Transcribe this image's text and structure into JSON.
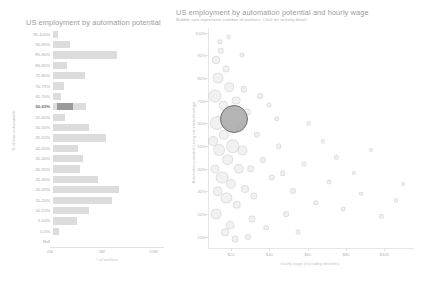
{
  "left_chart": {
    "title": "US employment by automation potential",
    "yaxis_title": "% of time automatable",
    "xaxis_title": "# of workers",
    "xticks": [
      "0M",
      "5M",
      "10M"
    ],
    "selected_band": "60-65%",
    "bands": [
      {
        "label": "95-100%",
        "workers_m": 0.45
      },
      {
        "label": "90-95%",
        "workers_m": 1.6
      },
      {
        "label": "85-90%",
        "workers_m": 6.15
      },
      {
        "label": "80-85%",
        "workers_m": 1.35
      },
      {
        "label": "75-80%",
        "workers_m": 3.05
      },
      {
        "label": "70-75%",
        "workers_m": 1.05
      },
      {
        "label": "65-70%",
        "workers_m": 0.8
      },
      {
        "label": "60-65%",
        "workers_m": 3.2
      },
      {
        "label": "55-60%",
        "workers_m": 1.2
      },
      {
        "label": "50-55%",
        "workers_m": 3.45
      },
      {
        "label": "45-50%",
        "workers_m": 5.1
      },
      {
        "label": "40-45%",
        "workers_m": 2.4
      },
      {
        "label": "35-40%",
        "workers_m": 2.85
      },
      {
        "label": "30-35%",
        "workers_m": 2.6
      },
      {
        "label": "25-30%",
        "workers_m": 4.35
      },
      {
        "label": "20-25%",
        "workers_m": 6.4
      },
      {
        "label": "15-20%",
        "workers_m": 5.7
      },
      {
        "label": "10-15%",
        "workers_m": 3.5
      },
      {
        "label": "5-10%",
        "workers_m": 2.35
      },
      {
        "label": "0-5%",
        "workers_m": 0.55
      },
      {
        "label": "Null",
        "workers_m": 0.0
      }
    ]
  },
  "right_chart": {
    "title": "US employment by automation potential and hourly wage",
    "subtitle": "Bubble size represents number of workers.  Click for activity detail",
    "yaxis_title": "Automation potential (using current technology)",
    "xaxis_title": "hourly wage (excluding benefits)",
    "yticks": [
      "100%",
      "90%",
      "80%",
      "70%",
      "60%",
      "50%",
      "40%",
      "30%",
      "20%",
      "10%"
    ],
    "xticks": [
      "$20",
      "$40",
      "$60",
      "$80",
      "$100"
    ],
    "selected_bubble": {
      "wage": 21.5,
      "automation_pct": 62,
      "size_px": 26
    }
  },
  "chart_data": [
    {
      "type": "bar",
      "title": "US employment by automation potential",
      "xlabel": "# of workers",
      "ylabel": "% of time automatable",
      "orientation": "horizontal",
      "categories": [
        "95-100%",
        "90-95%",
        "85-90%",
        "80-85%",
        "75-80%",
        "70-75%",
        "65-70%",
        "60-65%",
        "55-60%",
        "50-55%",
        "45-50%",
        "40-45%",
        "35-40%",
        "30-35%",
        "25-30%",
        "20-25%",
        "15-20%",
        "10-15%",
        "5-10%",
        "0-5%",
        "Null"
      ],
      "values": [
        0.45,
        1.6,
        6.15,
        1.35,
        3.05,
        1.05,
        0.8,
        3.2,
        1.2,
        3.45,
        5.1,
        2.4,
        2.85,
        2.6,
        4.35,
        6.4,
        5.7,
        3.5,
        2.35,
        0.55,
        0.0
      ],
      "value_unit": "millions of workers",
      "xlim": [
        0,
        11
      ],
      "xtick_values": [
        0,
        5,
        10
      ],
      "xtick_labels": [
        "0M",
        "5M",
        "10M"
      ],
      "grid": false,
      "legend": "none",
      "highlight": {
        "category": "60-65%",
        "sub_value": 1.55
      }
    },
    {
      "type": "scatter",
      "title": "US employment by automation potential and hourly wage",
      "subtitle": "Bubble size represents number of workers.  Click for activity detail",
      "xlabel": "hourly wage (excluding benefits)",
      "ylabel": "Automation potential (using current technology)",
      "xlim": [
        8,
        115
      ],
      "ylim": [
        5,
        102
      ],
      "xtick_values": [
        20,
        40,
        60,
        80,
        100
      ],
      "xtick_labels": [
        "$20",
        "$40",
        "$60",
        "$80",
        "$100"
      ],
      "ytick_values": [
        10,
        20,
        30,
        40,
        50,
        60,
        70,
        80,
        90,
        100
      ],
      "ytick_labels": [
        "10%",
        "20%",
        "30%",
        "40%",
        "50%",
        "60%",
        "70%",
        "80%",
        "90%",
        "100%"
      ],
      "grid": false,
      "legend": "none",
      "size_encodes": "number of workers",
      "selected_point": {
        "x": 21.5,
        "y": 62
      },
      "points": [
        {
          "x": 12.1,
          "y": 88,
          "r": 3.0
        },
        {
          "x": 13.4,
          "y": 80,
          "r": 4.5
        },
        {
          "x": 14.8,
          "y": 92,
          "r": 2.2
        },
        {
          "x": 11.4,
          "y": 72,
          "r": 5.5
        },
        {
          "x": 15.9,
          "y": 68,
          "r": 3.2
        },
        {
          "x": 17.2,
          "y": 84,
          "r": 2.6
        },
        {
          "x": 12.9,
          "y": 60,
          "r": 6.0
        },
        {
          "x": 19.0,
          "y": 76,
          "r": 3.8
        },
        {
          "x": 16.4,
          "y": 55,
          "r": 4.2
        },
        {
          "x": 13.8,
          "y": 48,
          "r": 5.0
        },
        {
          "x": 21.5,
          "y": 62,
          "r": 13.0
        },
        {
          "x": 22.8,
          "y": 70,
          "r": 3.4
        },
        {
          "x": 18.3,
          "y": 44,
          "r": 4.8
        },
        {
          "x": 24.5,
          "y": 58,
          "r": 3.0
        },
        {
          "x": 15.2,
          "y": 36,
          "r": 5.4
        },
        {
          "x": 20.1,
          "y": 33,
          "r": 4.0
        },
        {
          "x": 26.0,
          "y": 48,
          "r": 3.6
        },
        {
          "x": 28.4,
          "y": 65,
          "r": 2.4
        },
        {
          "x": 17.6,
          "y": 27,
          "r": 4.6
        },
        {
          "x": 23.1,
          "y": 24,
          "r": 3.2
        },
        {
          "x": 30.2,
          "y": 40,
          "r": 2.8
        },
        {
          "x": 12.4,
          "y": 20,
          "r": 4.4
        },
        {
          "x": 33.5,
          "y": 55,
          "r": 2.2
        },
        {
          "x": 27.3,
          "y": 31,
          "r": 3.0
        },
        {
          "x": 36.8,
          "y": 44,
          "r": 2.0
        },
        {
          "x": 19.5,
          "y": 15,
          "r": 3.4
        },
        {
          "x": 41.2,
          "y": 36,
          "r": 2.4
        },
        {
          "x": 45.0,
          "y": 50,
          "r": 1.8
        },
        {
          "x": 31.0,
          "y": 18,
          "r": 2.6
        },
        {
          "x": 52.5,
          "y": 30,
          "r": 2.0
        },
        {
          "x": 58.0,
          "y": 42,
          "r": 1.6
        },
        {
          "x": 64.3,
          "y": 25,
          "r": 1.8
        },
        {
          "x": 71.0,
          "y": 34,
          "r": 1.5
        },
        {
          "x": 78.6,
          "y": 22,
          "r": 1.4
        },
        {
          "x": 88.0,
          "y": 29,
          "r": 1.3
        },
        {
          "x": 98.5,
          "y": 19,
          "r": 1.2
        },
        {
          "x": 106.0,
          "y": 26,
          "r": 1.1
        },
        {
          "x": 14.2,
          "y": 96,
          "r": 1.8
        },
        {
          "x": 25.6,
          "y": 90,
          "r": 1.6
        },
        {
          "x": 35.1,
          "y": 72,
          "r": 1.9
        },
        {
          "x": 43.8,
          "y": 62,
          "r": 1.7
        },
        {
          "x": 48.9,
          "y": 20,
          "r": 1.9
        },
        {
          "x": 10.6,
          "y": 52,
          "r": 4.0
        },
        {
          "x": 11.8,
          "y": 40,
          "r": 3.6
        },
        {
          "x": 13.0,
          "y": 30,
          "r": 3.8
        },
        {
          "x": 16.9,
          "y": 12,
          "r": 2.8
        },
        {
          "x": 22.0,
          "y": 9,
          "r": 2.4
        },
        {
          "x": 29.0,
          "y": 10,
          "r": 2.0
        },
        {
          "x": 38.4,
          "y": 14,
          "r": 1.8
        },
        {
          "x": 55.0,
          "y": 12,
          "r": 1.5
        },
        {
          "x": 68.0,
          "y": 52,
          "r": 1.2
        },
        {
          "x": 18.8,
          "y": 98,
          "r": 1.4
        },
        {
          "x": 20.9,
          "y": 50,
          "r": 5.8
        },
        {
          "x": 24.0,
          "y": 40,
          "r": 4.2
        },
        {
          "x": 26.8,
          "y": 75,
          "r": 2.2
        },
        {
          "x": 32.0,
          "y": 28,
          "r": 2.6
        },
        {
          "x": 40.0,
          "y": 68,
          "r": 1.6
        },
        {
          "x": 47.0,
          "y": 38,
          "r": 1.8
        },
        {
          "x": 60.5,
          "y": 60,
          "r": 1.3
        },
        {
          "x": 75.0,
          "y": 45,
          "r": 1.2
        },
        {
          "x": 84.0,
          "y": 38,
          "r": 1.1
        },
        {
          "x": 93.0,
          "y": 48,
          "r": 1.0
        },
        {
          "x": 110.0,
          "y": 33,
          "r": 1.0
        }
      ]
    }
  ]
}
